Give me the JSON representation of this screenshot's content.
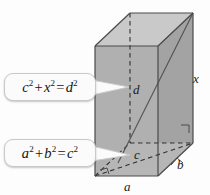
{
  "figure": {
    "background_color": "#fdfdfd",
    "face_colors": {
      "top": "#c9c9c9",
      "front_left": "#b4b4b4",
      "front_right": "#a6a6a6",
      "bottom": "#b0b0b0",
      "stroke": "#4a4a4a",
      "dashed_stroke": "#2e2e2e"
    },
    "callouts": [
      {
        "id": "callout-top",
        "name": "callout-c-x-d",
        "terms": [
          "c",
          "x",
          "d"
        ],
        "expression": "c2 + x2 = d2",
        "lhs_first": "c",
        "lhs_first_exp": "2",
        "operator_plus": "+",
        "lhs_second": "x",
        "lhs_second_exp": "2",
        "operator_equals": "=",
        "rhs": "d",
        "rhs_exp": "2"
      },
      {
        "id": "callout-bottom",
        "name": "callout-a-b-c",
        "terms": [
          "a",
          "b",
          "c"
        ],
        "expression": "a2 + b2 = c2",
        "lhs_first": "a",
        "lhs_first_exp": "2",
        "operator_plus": "+",
        "lhs_second": "b",
        "lhs_second_exp": "2",
        "operator_equals": "=",
        "rhs": "c",
        "rhs_exp": "2"
      }
    ],
    "edge_labels": {
      "height": "x",
      "depth": "b",
      "width": "a",
      "base_diagonal": "c",
      "space_diagonal": "d"
    },
    "right_angle_marks": 3
  }
}
